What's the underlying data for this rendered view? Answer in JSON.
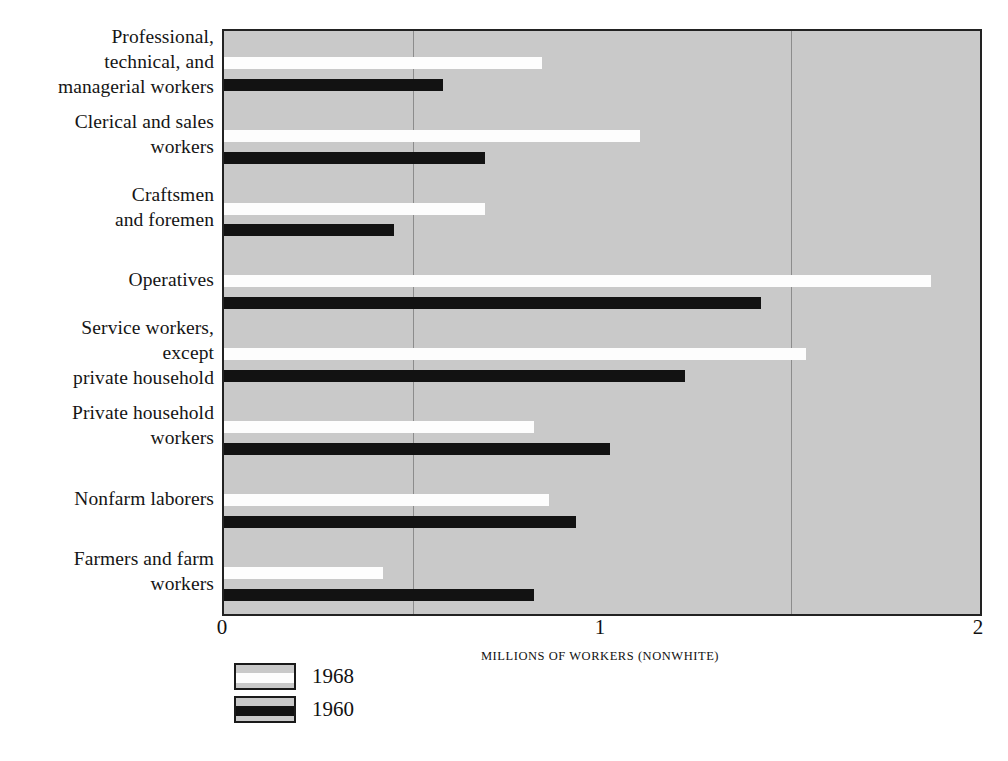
{
  "chart_data": {
    "type": "bar",
    "orientation": "horizontal",
    "title": "",
    "xlabel": "MILLIONS OF WORKERS (NONWHITE)",
    "ylabel": "",
    "xlim": [
      0,
      2
    ],
    "xticks": [
      0,
      1,
      2
    ],
    "xtick_labels": [
      "0",
      "1",
      "2"
    ],
    "gridlines_x": [
      0.5,
      1.5
    ],
    "grid": true,
    "legend_position": "below-left",
    "categories": [
      "Professional, technical, and managerial workers",
      "Clerical and sales workers",
      "Craftsmen and foremen",
      "Operatives",
      "Service workers, except private household",
      "Private household workers",
      "Nonfarm laborers",
      "Farmers and farm workers"
    ],
    "category_lines": [
      [
        "Professional,",
        "technical, and",
        "managerial workers"
      ],
      [
        "Clerical and sales",
        "workers"
      ],
      [
        "Craftsmen",
        "and foremen"
      ],
      [
        "Operatives"
      ],
      [
        "Service workers,",
        "except",
        "private household"
      ],
      [
        "Private household",
        "workers"
      ],
      [
        "Nonfarm laborers"
      ],
      [
        "Farmers and farm",
        "workers"
      ]
    ],
    "series": [
      {
        "name": "1968",
        "color": "#fdfdfd",
        "values": [
          0.84,
          1.1,
          0.69,
          1.87,
          1.54,
          0.82,
          0.86,
          0.42
        ]
      },
      {
        "name": "1960",
        "color": "#121212",
        "values": [
          0.58,
          0.69,
          0.45,
          1.42,
          1.22,
          1.02,
          0.93,
          0.82
        ]
      }
    ],
    "plot_background_color": "#c9c9c9",
    "frame_color": "#222222",
    "gridline_color": "#8c8c8c"
  },
  "legend": {
    "items": [
      {
        "label": "1968",
        "series": "1968"
      },
      {
        "label": "1960",
        "series": "1960"
      }
    ]
  },
  "axis": {
    "x_title": "MILLIONS OF WORKERS (NONWHITE)",
    "tick_0": "0",
    "tick_1": "1",
    "tick_2": "2"
  }
}
